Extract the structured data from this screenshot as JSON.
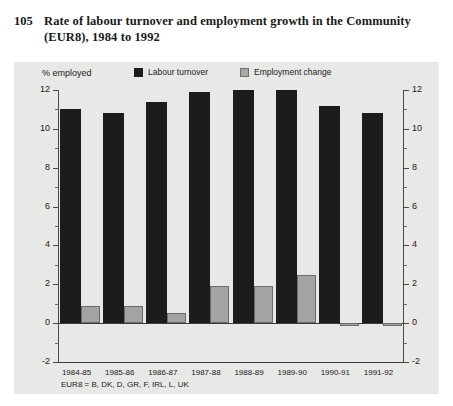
{
  "figure": {
    "number": "105",
    "title": "Rate of labour turnover and employment growth in the Community (EUR8), 1984 to 1992"
  },
  "chart_data": {
    "type": "bar",
    "title": "Rate of labour turnover and employment growth in the Community (EUR8), 1984 to 1992",
    "subtitle": "",
    "xlabel": "",
    "ylabel": "% employed",
    "ylim": [
      -2,
      12
    ],
    "ytick_labels": [
      "12",
      "10",
      "8",
      "6",
      "4",
      "2",
      "0",
      "-2"
    ],
    "ytick_values": [
      12,
      10,
      8,
      6,
      4,
      2,
      0,
      -2
    ],
    "minor_tick_step": 1,
    "grid": false,
    "legend_position": "top",
    "dual_axis": true,
    "categories": [
      "1984-85",
      "1985-86",
      "1986-87",
      "1987-88",
      "1988-89",
      "1989-90",
      "1990-91",
      "1991-92"
    ],
    "series": [
      {
        "name": "Labour turnover",
        "color": "#1c1c1c",
        "values": [
          11.0,
          10.8,
          11.4,
          11.9,
          12.0,
          12.0,
          11.2,
          10.8
        ]
      },
      {
        "name": "Employment change",
        "color": "#a3a3a3",
        "values": [
          0.9,
          0.9,
          0.5,
          1.9,
          1.9,
          2.5,
          -0.1,
          -0.1
        ]
      }
    ],
    "annotations": [
      "EUR8 = B, DK, D, GR, F, IRL, L, UK"
    ]
  },
  "axis_unit_label": "% employed",
  "footnote": "EUR8 = B, DK, D, GR, F, IRL, L, UK"
}
